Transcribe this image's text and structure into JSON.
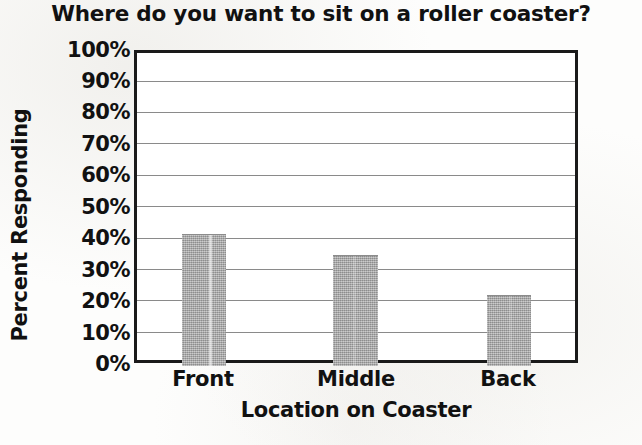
{
  "chart_data": {
    "type": "bar",
    "title": "Where do you want to sit on a roller coaster?",
    "xlabel": "Location on Coaster",
    "ylabel": "Percent Responding",
    "categories": [
      "Front",
      "Middle",
      "Back"
    ],
    "values": [
      43,
      36,
      23
    ],
    "value_labels": [
      "43%",
      "36%",
      "23%"
    ],
    "ylim": [
      0,
      100
    ],
    "ytick_labels": [
      "100%",
      "90%",
      "80%",
      "70%",
      "60%",
      "50%",
      "40%",
      "30%",
      "20%",
      "10%",
      "0%"
    ],
    "ytick_values": [
      100,
      90,
      80,
      70,
      60,
      50,
      40,
      30,
      20,
      10,
      0
    ],
    "grid": true,
    "legend": false,
    "series": [
      {
        "name": "Percent Responding",
        "values": [
          43,
          36,
          23
        ]
      }
    ],
    "colors": {
      "bar_fill": "#9a9a9a",
      "grid": "#8a8a8a",
      "frame": "#1a1a1a",
      "text": "#111111",
      "background": "#fdfdfc"
    }
  }
}
